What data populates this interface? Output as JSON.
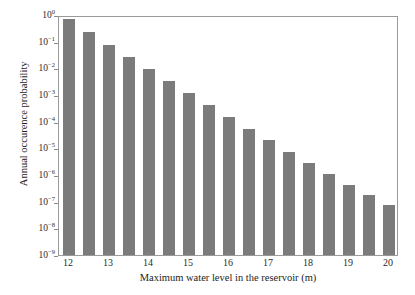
{
  "chart_data": {
    "type": "bar",
    "title": "",
    "xlabel": "Maximum water level in the reservoir (m)",
    "ylabel": "Annual occurence probability",
    "yscale": "log",
    "ylim": [
      1e-09,
      1
    ],
    "xlim": [
      11.75,
      20.25
    ],
    "grid": false,
    "bar_color": "#7b7b7b",
    "categories": [
      12,
      12.5,
      13,
      13.5,
      14,
      14.5,
      15,
      15.5,
      16,
      16.5,
      17,
      17.5,
      18,
      18.5,
      19,
      19.5,
      20
    ],
    "values": [
      0.7,
      0.23,
      0.078,
      0.027,
      0.0097,
      0.0035,
      0.0012,
      0.00043,
      0.00015,
      5.4e-05,
      2e-05,
      7.5e-06,
      2.8e-06,
      1.05e-06,
      4.3e-07,
      1.75e-07,
      7.3e-08
    ],
    "series": [
      {
        "name": "Annual occurence probability",
        "values": [
          0.7,
          0.23,
          0.078,
          0.027,
          0.0097,
          0.0035,
          0.0012,
          0.00043,
          0.00015,
          5.4e-05,
          2e-05,
          7.5e-06,
          2.8e-06,
          1.05e-06,
          4.3e-07,
          1.75e-07,
          7.3e-08
        ]
      }
    ],
    "xticks": [
      12,
      13,
      14,
      15,
      16,
      17,
      18,
      19,
      20
    ],
    "xtick_labels": [
      "12",
      "13",
      "14",
      "15",
      "16",
      "17",
      "18",
      "19",
      "20"
    ],
    "yticks": [
      1,
      0.1,
      0.01,
      0.001,
      0.0001,
      1e-05,
      1e-06,
      1e-07,
      1e-08,
      1e-09
    ],
    "ytick_labels": [
      "10^0",
      "10^-1",
      "10^-2",
      "10^-3",
      "10^-4",
      "10^-5",
      "10^-6",
      "10^-7",
      "10^-8",
      "10^-9"
    ],
    "ytick_mantissa": [
      "10",
      "10",
      "10",
      "10",
      "10",
      "10",
      "10",
      "10",
      "10",
      "10"
    ],
    "ytick_exponent": [
      "0",
      "-1",
      "-2",
      "-3",
      "-4",
      "-5",
      "-6",
      "-7",
      "-8",
      "-9"
    ],
    "legend": null,
    "annotations": []
  }
}
